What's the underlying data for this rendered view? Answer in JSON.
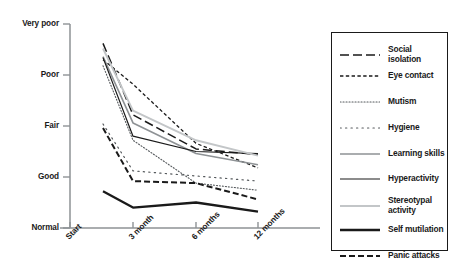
{
  "chart_data": {
    "type": "line",
    "title": "",
    "xlabel": "",
    "ylabel": "",
    "categories": [
      "Start",
      "3 month",
      "6 months",
      "12 months"
    ],
    "y_tick_labels": [
      "Very poor",
      "Poor",
      "Fair",
      "Good",
      "Normal"
    ],
    "y_scale_ordinal": [
      5,
      4,
      3,
      2,
      1
    ],
    "ylim": [
      "Normal",
      "Very poor"
    ],
    "grid": false,
    "legend_position": "right",
    "series": [
      {
        "name": "Social isolation",
        "style": "long-dash",
        "color": "#1a1a1a",
        "width": 1.5,
        "values": [
          4.62,
          3.22,
          2.55,
          2.44
        ]
      },
      {
        "name": "Eye contact",
        "style": "short-dash",
        "color": "#1a1a1a",
        "width": 1.3,
        "values": [
          4.3,
          3.82,
          2.66,
          2.18
        ]
      },
      {
        "name": "Mutism",
        "style": "fine-dot",
        "color": "#55595c",
        "width": 1.1,
        "values": [
          4.18,
          2.72,
          1.88,
          1.74
        ]
      },
      {
        "name": "Hygiene",
        "style": "sparse-dot",
        "color": "#55595c",
        "width": 1.2,
        "values": [
          3.04,
          2.12,
          2.02,
          1.92
        ]
      },
      {
        "name": "Learning skills",
        "style": "solid-gray",
        "color": "#8e9295",
        "width": 1.6,
        "values": [
          4.36,
          3.06,
          2.46,
          2.24
        ]
      },
      {
        "name": "Hyperactivity",
        "style": "solid-thin",
        "color": "#1a1a1a",
        "width": 1.2,
        "values": [
          4.34,
          2.8,
          2.5,
          2.46
        ]
      },
      {
        "name": "Stereotypal activity",
        "style": "solid-lightgray",
        "color": "#c3c6c8",
        "width": 1.9,
        "values": [
          4.52,
          3.3,
          2.72,
          2.42
        ]
      },
      {
        "name": "Self mutilation",
        "style": "solid-thick",
        "color": "#1a1a1a",
        "width": 2.3,
        "values": [
          1.72,
          1.4,
          1.5,
          1.32
        ]
      },
      {
        "name": "Panic attacks",
        "style": "medium-dash",
        "color": "#1a1a1a",
        "width": 2.0,
        "values": [
          2.96,
          1.92,
          1.88,
          1.56
        ]
      }
    ]
  },
  "axes": {
    "y_ticks": [
      {
        "label": "Very poor",
        "value": 5
      },
      {
        "label": "Poor",
        "value": 4
      },
      {
        "label": "Fair",
        "value": 3
      },
      {
        "label": "Good",
        "value": 2
      },
      {
        "label": "Normal",
        "value": 1
      }
    ],
    "x_ticks": [
      "Start",
      "3 month",
      "6 months",
      "12 months"
    ]
  },
  "legend": {
    "items": [
      {
        "label": "Social isolation"
      },
      {
        "label": "Eye contact"
      },
      {
        "label": "Mutism"
      },
      {
        "label": "Hygiene"
      },
      {
        "label": "Learning skills"
      },
      {
        "label": "Hyperactivity"
      },
      {
        "label": "Stereotypal\nactivity"
      },
      {
        "label": "Self mutilation"
      },
      {
        "label": "Panic attacks"
      }
    ]
  },
  "colors": {
    "axis": "#8e9295",
    "ink": "#1a1a1a",
    "gray": "#8e9295",
    "light_gray": "#c3c6c8",
    "background": "#ffffff"
  }
}
